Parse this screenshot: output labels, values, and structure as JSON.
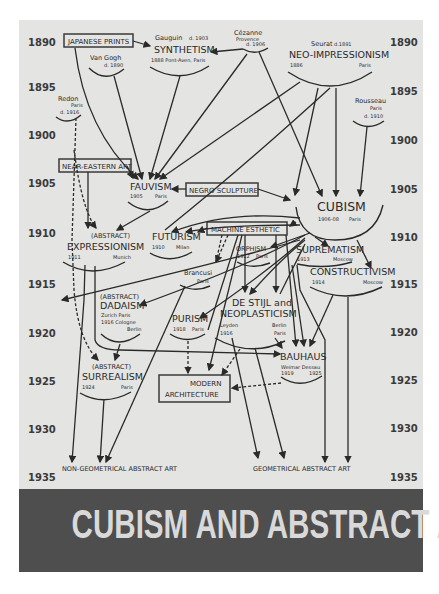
{
  "cover": {
    "title": "CUBISM AND ABSTRACT ART",
    "colors": {
      "page": "#e4e4e2",
      "band": "#4e4e4e",
      "band_text": "#d9d9d9",
      "ink": "#2a2a2a"
    }
  },
  "timeline": {
    "years": [
      "1890",
      "1895",
      "1900",
      "1905",
      "1910",
      "1915",
      "1920",
      "1925",
      "1930",
      "1935"
    ]
  },
  "influences": {
    "japanese_prints": "JAPANESE PRINTS",
    "near_eastern_art": "NEAR-EASTERN ART",
    "negro_sculpture": "NEGRO SCULPTURE",
    "machine_esthetic": "MACHINE ESTHETIC",
    "modern_architecture_1": "MODERN",
    "modern_architecture_2": "ARCHITECTURE"
  },
  "artists": {
    "gauguin": {
      "name": "Gauguin",
      "note": "d. 1903"
    },
    "van_gogh": {
      "name": "Van Gogh",
      "note": "d. 1890"
    },
    "cezanne": {
      "name": "Cézanne",
      "place": "Provence",
      "note": "d. 1906"
    },
    "seurat": {
      "name": "Seurat",
      "note": "d.1891"
    },
    "redon": {
      "name": "Redon",
      "place": "Paris",
      "note": "d. 1916"
    },
    "rousseau": {
      "name": "Rousseau",
      "place": "Paris",
      "note": "d. 1910"
    },
    "brancusi": {
      "name": "Brancusi",
      "place": "Paris"
    }
  },
  "movements": {
    "synthetism": {
      "name": "SYNTHETISM",
      "detail": "1888  Pont-Aven, Paris"
    },
    "neo_impressionism": {
      "name": "NEO-IMPRESSIONISM",
      "year": "1886",
      "place": "Paris"
    },
    "fauvism": {
      "name": "FAUVISM",
      "year": "1905",
      "place": "Paris"
    },
    "cubism": {
      "name": "CUBISM",
      "year": "1906-08",
      "place": "Paris"
    },
    "expressionism": {
      "prefix": "(ABSTRACT)",
      "name": "EXPRESSIONISM",
      "year": "1911",
      "place": "Munich"
    },
    "futurism": {
      "name": "FUTURISM",
      "year": "1910",
      "place": "Milan"
    },
    "orphism": {
      "name": "ORPHISM",
      "year": "1912",
      "place": "Paris"
    },
    "suprematism": {
      "name": "SUPREMATISM",
      "year": "1913",
      "place": "Moscow"
    },
    "constructivism": {
      "name": "CONSTRUCTIVISM",
      "year": "1914",
      "place": "Moscow"
    },
    "dadaism": {
      "prefix": "(ABSTRACT)",
      "name": "DADAISM",
      "line1": "Zurich   Paris",
      "line2": "1916  Cologne",
      "line3": "Berlin"
    },
    "de_stijl": {
      "name1": "DE STIJL and",
      "name2": "NEOPLASTICISM",
      "left1": "Leyden",
      "left2": "1916",
      "right1": "Berlin",
      "right2": "Paris"
    },
    "purism": {
      "name": "PURISM",
      "year": "1918",
      "place": "Paris"
    },
    "bauhaus": {
      "name": "BAUHAUS",
      "places": "Weimar  Dessau",
      "year1": "1919",
      "year2": "1925"
    },
    "surrealism": {
      "prefix": "(ABSTRACT)",
      "name": "SURREALISM",
      "year": "1924",
      "place": "Paris"
    }
  },
  "outcomes": {
    "non_geometrical": "NON-GEOMETRICAL ABSTRACT ART",
    "geometrical": "GEOMETRICAL ABSTRACT ART"
  }
}
